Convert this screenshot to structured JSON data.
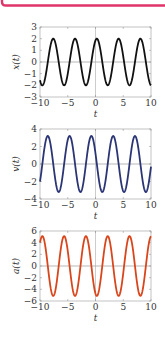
{
  "frame": {
    "accent_color": "#e0356a"
  },
  "chart_data": [
    {
      "type": "line",
      "title": "",
      "xlabel": "t",
      "ylabel": "x(t)",
      "xlim": [
        -10,
        10
      ],
      "ylim": [
        -3,
        3
      ],
      "xticks": [
        -10,
        -5,
        0,
        5,
        10
      ],
      "xtick_labels": [
        "−10",
        "−5",
        "0",
        "5",
        "10"
      ],
      "yticks": [
        -3,
        -2,
        -1,
        0,
        1,
        2,
        3
      ],
      "ytick_labels": [
        "−3",
        "−2",
        "−1",
        "0",
        "1",
        "2",
        "3"
      ],
      "grid": false,
      "color": "#111111",
      "function": "2*cos(1.6*(t-0.24))",
      "amplitude": 2,
      "omega": 1.6,
      "phase_shift": 0.24,
      "deriv": 0
    },
    {
      "type": "line",
      "title": "",
      "xlabel": "t",
      "ylabel": "v(t)",
      "xlim": [
        -10,
        10
      ],
      "ylim": [
        -4,
        4
      ],
      "xticks": [
        -10,
        -5,
        0,
        5,
        10
      ],
      "xtick_labels": [
        "−10",
        "−5",
        "0",
        "5",
        "10"
      ],
      "yticks": [
        -4,
        -2,
        0,
        2,
        4
      ],
      "ytick_labels": [
        "−4",
        "−2",
        "0",
        "2",
        "4"
      ],
      "grid": false,
      "color": "#2b3576",
      "function": "-3.2*sin(1.6*(t-0.24))",
      "amplitude": 2,
      "omega": 1.6,
      "phase_shift": 0.24,
      "deriv": 1
    },
    {
      "type": "line",
      "title": "",
      "xlabel": "t",
      "ylabel": "a(t)",
      "xlim": [
        -10,
        10
      ],
      "ylim": [
        -6,
        6
      ],
      "xticks": [
        -10,
        -5,
        0,
        5,
        10
      ],
      "xtick_labels": [
        "−10",
        "−5",
        "0",
        "5",
        "10"
      ],
      "yticks": [
        -6,
        -4,
        -2,
        0,
        2,
        4,
        6
      ],
      "ytick_labels": [
        "−6",
        "−4",
        "−2",
        "0",
        "2",
        "4",
        "6"
      ],
      "grid": false,
      "color": "#d9461c",
      "function": "-5.12*cos(1.6*(t-0.24))",
      "amplitude": 2,
      "omega": 1.6,
      "phase_shift": 0.24,
      "deriv": 2
    }
  ]
}
